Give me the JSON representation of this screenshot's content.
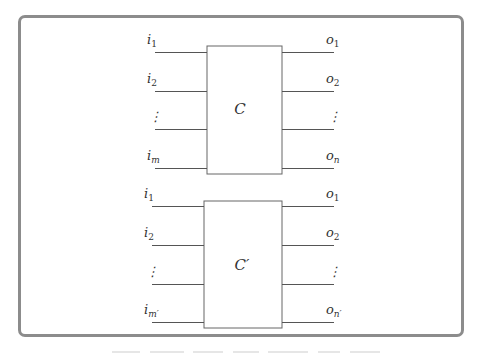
{
  "diagram": {
    "circuits": [
      {
        "name": "C",
        "label": "C",
        "inputs": [
          {
            "base": "i",
            "sub": "1"
          },
          {
            "base": "i",
            "sub": "2"
          },
          {
            "base": "⋮",
            "sub": ""
          },
          {
            "base": "i",
            "sub": "m"
          }
        ],
        "outputs": [
          {
            "base": "o",
            "sub": "1"
          },
          {
            "base": "o",
            "sub": "2"
          },
          {
            "base": "⋮",
            "sub": ""
          },
          {
            "base": "o",
            "sub": "n"
          }
        ]
      },
      {
        "name": "C-prime",
        "label": "C′",
        "inputs": [
          {
            "base": "i",
            "sub": "1"
          },
          {
            "base": "i",
            "sub": "2"
          },
          {
            "base": "⋮",
            "sub": ""
          },
          {
            "base": "i",
            "sub": "m′"
          }
        ],
        "outputs": [
          {
            "base": "o",
            "sub": "1"
          },
          {
            "base": "o",
            "sub": "2"
          },
          {
            "base": "⋮",
            "sub": ""
          },
          {
            "base": "o",
            "sub": "n′"
          }
        ]
      }
    ]
  }
}
